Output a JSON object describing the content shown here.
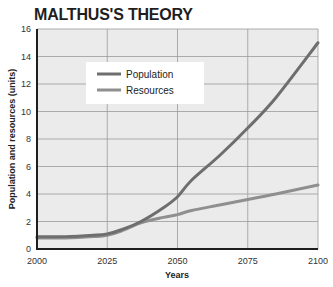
{
  "chart_data": {
    "type": "line",
    "title": "MALTHUS'S THEORY",
    "xlabel": "Years",
    "ylabel": "Population and resources (units)",
    "xlim": [
      2000,
      2100
    ],
    "ylim": [
      0,
      16
    ],
    "x_ticks": [
      2000,
      2025,
      2050,
      2075,
      2100
    ],
    "y_ticks": [
      0,
      2,
      4,
      6,
      8,
      10,
      12,
      14,
      16
    ],
    "grid": true,
    "legend_position": "upper-left-inside",
    "x": [
      2000,
      2010,
      2020,
      2025,
      2030,
      2037,
      2045,
      2050,
      2055,
      2065,
      2075,
      2085,
      2100
    ],
    "series": [
      {
        "name": "Population",
        "color": "#6e6e6e",
        "values": [
          0.9,
          0.9,
          1.0,
          1.1,
          1.4,
          2.0,
          3.0,
          3.8,
          5.0,
          6.8,
          8.8,
          11.0,
          15.0
        ]
      },
      {
        "name": "Resources",
        "color": "#8f8f8f",
        "values": [
          0.8,
          0.8,
          0.9,
          1.0,
          1.3,
          1.9,
          2.3,
          2.5,
          2.8,
          3.2,
          3.6,
          4.0,
          4.65
        ]
      }
    ]
  },
  "colors": {
    "plot_background": "#ebebeb",
    "grid": "#9a9a9a",
    "axis": "#1e1e1e"
  }
}
